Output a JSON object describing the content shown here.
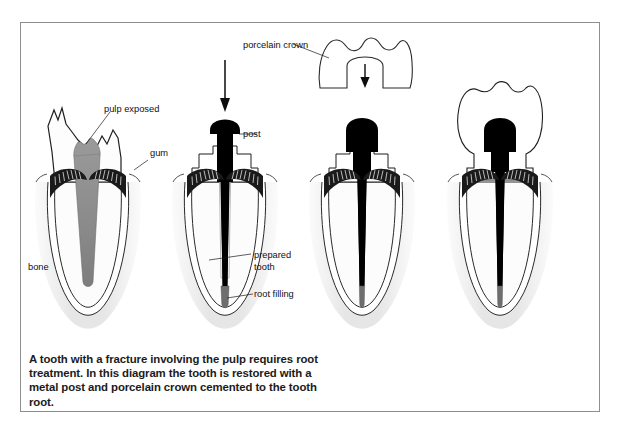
{
  "figure": {
    "title_caption": "A tooth with a fracture involving the pulp requires root treatment. In this diagram the tooth is restored with a metal post and porcelain crown cemented to the tooth root.",
    "border_color": "#8e8e8e",
    "background_color": "#ffffff",
    "ink_color": "#111111",
    "pulp_color": "#8f8f8f",
    "bone_color": "#ececec",
    "post_color": "#000000",
    "root_filling_color": "#6e6e6e"
  },
  "labels": {
    "pulp_exposed": "pulp exposed",
    "gum": "gum",
    "bone": "bone",
    "post": "post",
    "prepared_tooth_line1": "prepared",
    "prepared_tooth_line2": "tooth",
    "root_filling": "root filling",
    "porcelain_crown": "porcelain crown"
  },
  "panels": [
    {
      "index": 1,
      "name": "fractured-tooth-with-exposed-pulp",
      "center_x": 88
    },
    {
      "index": 2,
      "name": "prepared-tooth-with-post-insertion",
      "center_x": 225
    },
    {
      "index": 3,
      "name": "post-seated-crown-descending",
      "center_x": 362
    },
    {
      "index": 4,
      "name": "completed-crown-restoration",
      "center_x": 500
    }
  ],
  "annotations": {
    "arrow_post_insertion": "downward-arrow",
    "arrow_crown_seating": "downward-arrow"
  }
}
